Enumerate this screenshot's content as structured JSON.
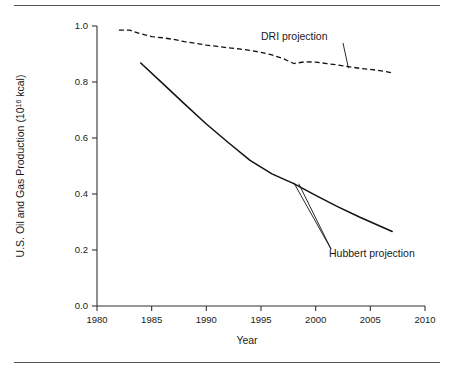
{
  "figure": {
    "background_color": "#ffffff",
    "rule_color": "#555555",
    "line_color": "#111111"
  },
  "labels": {
    "ylabel_main": "U.S. Oil and Gas Production (10",
    "ylabel_sup": "16",
    "ylabel_tail": " kcal)",
    "xlabel": "Year",
    "annotation_dri": "DRI projection",
    "annotation_hubbert": "Hubbert projection"
  },
  "ticks": {
    "y": [
      "0.0",
      "0.2",
      "0.4",
      "0.6",
      "0.8",
      "1.0"
    ],
    "x": [
      "1980",
      "1985",
      "1990",
      "1995",
      "2000",
      "2005",
      "2010"
    ]
  },
  "chart_data": {
    "type": "line",
    "title": "",
    "xlabel": "Year",
    "ylabel": "U.S. Oil and Gas Production (10^16 kcal)",
    "xlim": [
      1980,
      2010
    ],
    "ylim": [
      0.0,
      1.0
    ],
    "xticks": [
      1980,
      1985,
      1990,
      1995,
      2000,
      2005,
      2010
    ],
    "yticks": [
      0.0,
      0.2,
      0.4,
      0.6,
      0.8,
      1.0
    ],
    "grid": false,
    "legend": "annotations",
    "series": [
      {
        "name": "DRI projection",
        "style": "dashed",
        "color": "#111111",
        "x": [
          1982,
          1983,
          1984,
          1985,
          1986,
          1987,
          1988,
          1989,
          1990,
          1991,
          1992,
          1993,
          1994,
          1995,
          1996,
          1997,
          1998,
          1999,
          2000,
          2001,
          2002,
          2003,
          2004,
          2005,
          2006,
          2007
        ],
        "y": [
          0.985,
          0.985,
          0.972,
          0.962,
          0.958,
          0.952,
          0.944,
          0.938,
          0.932,
          0.927,
          0.922,
          0.918,
          0.913,
          0.906,
          0.897,
          0.884,
          0.866,
          0.872,
          0.871,
          0.866,
          0.861,
          0.855,
          0.849,
          0.845,
          0.84,
          0.833
        ],
        "annotation": {
          "text": "DRI projection",
          "points_to_x": 2003,
          "points_to_y": 0.849
        }
      },
      {
        "name": "Hubbert projection",
        "style": "solid",
        "color": "#111111",
        "x": [
          1984,
          1986,
          1988,
          1990,
          1992,
          1994,
          1996,
          1998,
          2000,
          2002,
          2004,
          2007
        ],
        "y": [
          0.868,
          0.795,
          0.722,
          0.65,
          0.584,
          0.52,
          0.472,
          0.437,
          0.395,
          0.355,
          0.318,
          0.266
        ],
        "annotation": {
          "text": "Hubbert projection",
          "points_to_x": 1998,
          "points_to_y": 0.44
        }
      }
    ]
  }
}
